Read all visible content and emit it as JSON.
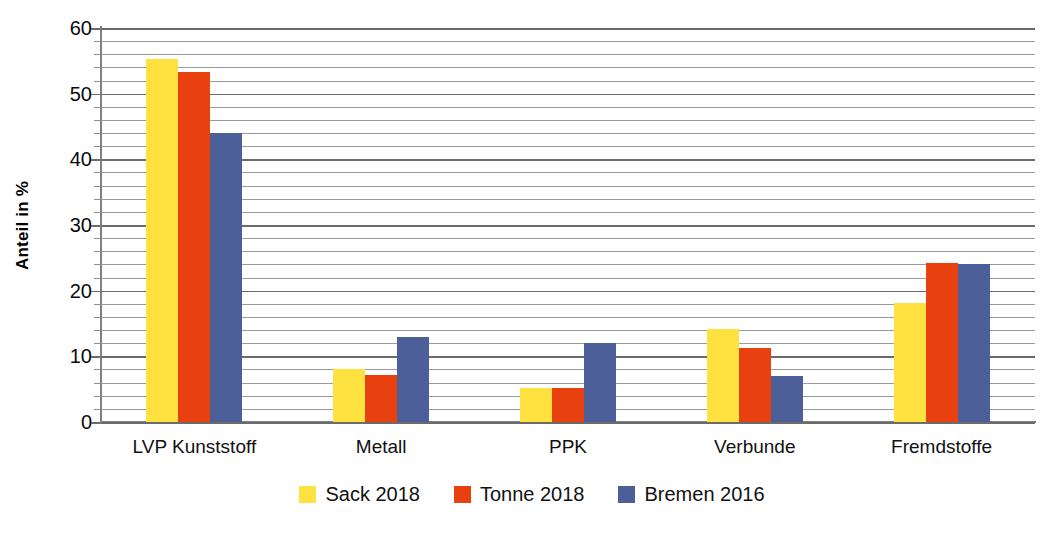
{
  "chart_data": {
    "type": "bar",
    "title": "",
    "subtitle": "",
    "xlabel": "",
    "ylabel": "Anteil in %",
    "ylim": [
      0,
      60
    ],
    "ytick_step": 10,
    "minor_gridline_step": 2,
    "grid": true,
    "legend_position": "bottom",
    "categories": [
      "LVP Kunststoff",
      "Metall",
      "PPK",
      "Verbunde",
      "Fremdstoffe"
    ],
    "series": [
      {
        "name": "Sack 2018",
        "color": "#FFE13F",
        "values": [
          55.3,
          8.1,
          5.2,
          14.2,
          18.1
        ]
      },
      {
        "name": "Tonne 2018",
        "color": "#E8400E",
        "values": [
          53.3,
          7.2,
          5.2,
          11.2,
          24.2
        ]
      },
      {
        "name": "Bremen 2016",
        "color": "#4C5F99",
        "values": [
          44.0,
          13.0,
          12.0,
          7.0,
          24.0
        ]
      }
    ],
    "ytick_labels": [
      "0",
      "10",
      "20",
      "30",
      "40",
      "50",
      "60"
    ]
  },
  "axes": {
    "y_axis_title": "Anteil in %"
  }
}
